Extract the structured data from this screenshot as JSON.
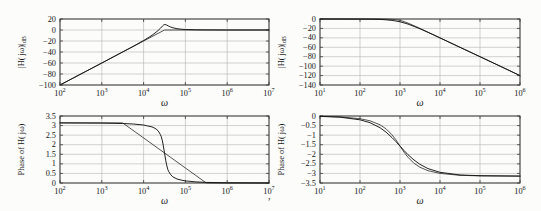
{
  "page": {
    "background": "#fcfcfb",
    "stray_mark": ","
  },
  "colors": {
    "grid": "#b3b3b3",
    "frame": "#3a3a3a",
    "curve_primary": "#141414",
    "curve_secondary": "#3f3f3f"
  },
  "chart_data": [
    {
      "id": "highpass-magnitude",
      "type": "line",
      "title": "",
      "xlabel": "ω",
      "ylabel": "|H( jω)|",
      "ylabel_sub": "dB",
      "xscale": "log",
      "xtick_format": "power-of-10",
      "xlim": [
        2,
        7
      ],
      "ylim": [
        -100,
        20
      ],
      "xticks": [
        2,
        3,
        4,
        5,
        6,
        7
      ],
      "yticks": [
        20,
        0,
        -20,
        -40,
        -60,
        -80,
        -100
      ],
      "grid": true,
      "legend": null,
      "series": [
        {
          "name": "straight-line-approximation",
          "points": [
            [
              2,
              -100
            ],
            [
              4.5,
              0
            ],
            [
              7,
              0
            ]
          ]
        },
        {
          "name": "exact-response",
          "points": [
            [
              2,
              -100
            ],
            [
              2.5,
              -80
            ],
            [
              3,
              -60
            ],
            [
              3.5,
              -39.9
            ],
            [
              3.75,
              -29.8
            ],
            [
              4,
              -19.1
            ],
            [
              4.1,
              -14.6
            ],
            [
              4.2,
              -9.7
            ],
            [
              4.3,
              -4.0
            ],
            [
              4.35,
              -0.8
            ],
            [
              4.4,
              3.0
            ],
            [
              4.45,
              7.1
            ],
            [
              4.48,
              9.2
            ],
            [
              4.51,
              10.0
            ],
            [
              4.55,
              9.1
            ],
            [
              4.6,
              7.0
            ],
            [
              4.65,
              5.2
            ],
            [
              4.7,
              4.0
            ],
            [
              4.8,
              2.3
            ],
            [
              4.9,
              1.4
            ],
            [
              5,
              0.9
            ],
            [
              5.25,
              0.3
            ],
            [
              5.5,
              0.1
            ],
            [
              6,
              0
            ],
            [
              7,
              0
            ]
          ]
        }
      ]
    },
    {
      "id": "lowpass-magnitude",
      "type": "line",
      "title": "",
      "xlabel": "ω",
      "ylabel": "|H( jω)|",
      "ylabel_sub": "dB",
      "xscale": "log",
      "xtick_format": "power-of-10",
      "xlim": [
        1,
        6
      ],
      "ylim": [
        -140,
        0
      ],
      "xticks": [
        1,
        2,
        3,
        4,
        5,
        6
      ],
      "yticks": [
        0,
        -20,
        -40,
        -60,
        -80,
        -100,
        -120,
        -140
      ],
      "grid": true,
      "legend": null,
      "series": [
        {
          "name": "response-curve-1",
          "points": [
            [
              1,
              0
            ],
            [
              2,
              0
            ],
            [
              2.3,
              -0.05
            ],
            [
              2.5,
              -0.05
            ],
            [
              2.65,
              -0.17
            ],
            [
              2.8,
              -0.64
            ],
            [
              2.9,
              -1.45
            ],
            [
              3,
              -3.0
            ],
            [
              3.1,
              -5.5
            ],
            [
              3.2,
              -8.6
            ],
            [
              3.35,
              -14.2
            ],
            [
              3.5,
              -20.0
            ],
            [
              3.75,
              -30.0
            ],
            [
              4,
              -40.0
            ],
            [
              4.5,
              -60
            ],
            [
              5,
              -80
            ],
            [
              5.5,
              -100
            ],
            [
              6,
              -120
            ]
          ]
        },
        {
          "name": "response-curve-2",
          "points": [
            [
              1,
              0
            ],
            [
              2,
              -0.2
            ],
            [
              2.3,
              -0.34
            ],
            [
              2.5,
              -0.83
            ],
            [
              2.65,
              -1.6
            ],
            [
              2.8,
              -2.9
            ],
            [
              2.9,
              -4.3
            ],
            [
              3,
              -6.0
            ],
            [
              3.1,
              -8.3
            ],
            [
              3.2,
              -10.9
            ],
            [
              3.35,
              -15.6
            ],
            [
              3.5,
              -20.8
            ],
            [
              3.75,
              -30.3
            ],
            [
              4,
              -40.1
            ],
            [
              4.5,
              -60
            ],
            [
              5,
              -80
            ],
            [
              5.5,
              -100
            ],
            [
              6,
              -120
            ]
          ]
        }
      ]
    },
    {
      "id": "highpass-phase",
      "type": "line",
      "title": "",
      "xlabel": "ω",
      "ylabel": "Phase of H( jω)",
      "ylabel_sub": "",
      "xscale": "log",
      "xtick_format": "power-of-10",
      "xlim": [
        2,
        7
      ],
      "ylim": [
        0,
        3.5
      ],
      "xticks": [
        2,
        3,
        4,
        5,
        6,
        7
      ],
      "yticks": [
        3.5,
        3,
        2.5,
        2,
        1.5,
        1,
        0.5,
        0
      ],
      "grid": true,
      "legend": null,
      "series": [
        {
          "name": "straight-line-approximation",
          "points": [
            [
              2,
              3.14
            ],
            [
              3.5,
              3.14
            ],
            [
              5.5,
              0
            ],
            [
              7,
              0
            ]
          ]
        },
        {
          "name": "exact-response",
          "points": [
            [
              2,
              3.14
            ],
            [
              3,
              3.13
            ],
            [
              3.5,
              3.11
            ],
            [
              3.75,
              3.08
            ],
            [
              4,
              3.03
            ],
            [
              4.1,
              2.98
            ],
            [
              4.2,
              2.93
            ],
            [
              4.25,
              2.88
            ],
            [
              4.3,
              2.82
            ],
            [
              4.35,
              2.72
            ],
            [
              4.4,
              2.54
            ],
            [
              4.42,
              2.43
            ],
            [
              4.45,
              2.2
            ],
            [
              4.47,
              1.98
            ],
            [
              4.5,
              1.57
            ],
            [
              4.53,
              1.16
            ],
            [
              4.55,
              0.95
            ],
            [
              4.58,
              0.71
            ],
            [
              4.6,
              0.6
            ],
            [
              4.65,
              0.43
            ],
            [
              4.7,
              0.32
            ],
            [
              4.8,
              0.21
            ],
            [
              4.9,
              0.15
            ],
            [
              5,
              0.11
            ],
            [
              5.25,
              0.06
            ],
            [
              5.5,
              0.03
            ],
            [
              6,
              0.01
            ],
            [
              7,
              0
            ]
          ]
        }
      ]
    },
    {
      "id": "lowpass-phase",
      "type": "line",
      "title": "",
      "xlabel": "ω",
      "ylabel": "Phase of H( jω)",
      "ylabel_sub": "",
      "xscale": "log",
      "xtick_format": "power-of-10",
      "xlim": [
        1,
        6
      ],
      "ylim": [
        -3.5,
        0
      ],
      "xticks": [
        1,
        2,
        3,
        4,
        5,
        6
      ],
      "yticks": [
        0,
        -0.5,
        -1,
        -1.5,
        -2,
        -2.5,
        -3,
        -3.5
      ],
      "grid": true,
      "legend": null,
      "series": [
        {
          "name": "response-curve-1",
          "points": [
            [
              1,
              -0.01
            ],
            [
              1.5,
              -0.045
            ],
            [
              2,
              -0.14
            ],
            [
              2.25,
              -0.25
            ],
            [
              2.5,
              -0.46
            ],
            [
              2.65,
              -0.67
            ],
            [
              2.8,
              -0.98
            ],
            [
              2.9,
              -1.25
            ],
            [
              3,
              -1.57
            ],
            [
              3.1,
              -1.89
            ],
            [
              3.2,
              -2.16
            ],
            [
              3.35,
              -2.47
            ],
            [
              3.5,
              -2.68
            ],
            [
              3.7,
              -2.86
            ],
            [
              4,
              -3.0
            ],
            [
              4.5,
              -3.1
            ],
            [
              5,
              -3.13
            ],
            [
              5.5,
              -3.135
            ],
            [
              6,
              -3.14
            ]
          ]
        },
        {
          "name": "response-curve-2",
          "points": [
            [
              1,
              -0.02
            ],
            [
              1.5,
              -0.063
            ],
            [
              2,
              -0.2
            ],
            [
              2.25,
              -0.35
            ],
            [
              2.5,
              -0.61
            ],
            [
              2.65,
              -0.84
            ],
            [
              2.8,
              -1.13
            ],
            [
              2.9,
              -1.34
            ],
            [
              3,
              -1.57
            ],
            [
              3.1,
              -1.8
            ],
            [
              3.2,
              -2.02
            ],
            [
              3.35,
              -2.3
            ],
            [
              3.5,
              -2.53
            ],
            [
              3.7,
              -2.75
            ],
            [
              4,
              -2.94
            ],
            [
              4.5,
              -3.08
            ],
            [
              5,
              -3.12
            ],
            [
              5.5,
              -3.13
            ],
            [
              6,
              -3.14
            ]
          ]
        }
      ]
    }
  ]
}
